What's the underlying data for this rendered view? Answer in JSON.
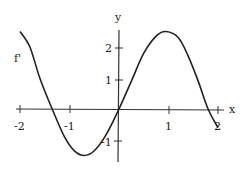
{
  "chart_data": {
    "type": "line",
    "title": "",
    "xlabel": "x",
    "ylabel": "y",
    "curve_label": "f'",
    "xlim": [
      -2,
      2
    ],
    "ylim": [
      -1.5,
      2.5
    ],
    "grid": false,
    "x_ticks": [
      "-2",
      "-1",
      "1",
      "2"
    ],
    "y_ticks": [
      "2",
      "1",
      "-1"
    ],
    "series": [
      {
        "name": "f'",
        "x": [
          -2.0,
          -1.8,
          -1.6,
          -1.35,
          -1.1,
          -0.9,
          -0.7,
          -0.5,
          -0.25,
          0.0,
          0.25,
          0.5,
          0.75,
          0.95,
          1.2,
          1.4,
          1.6,
          1.8,
          2.0
        ],
        "values": [
          2.5,
          2.0,
          1.0,
          0.0,
          -0.9,
          -1.35,
          -1.5,
          -1.35,
          -0.8,
          0.0,
          0.9,
          1.8,
          2.35,
          2.5,
          2.3,
          1.7,
          0.9,
          0.0,
          -0.6
        ]
      }
    ]
  },
  "colors": {
    "curve": "#222222",
    "axis": "#333333",
    "background": "#ffffff"
  }
}
